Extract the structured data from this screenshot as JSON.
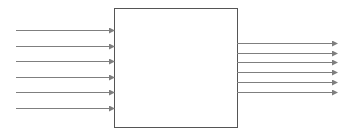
{
  "diagram": {
    "background": "#ffffff",
    "line_color": "#7f7f7f",
    "box_border_color": "#555555",
    "box": {
      "x": 114,
      "y": 8,
      "width": 123,
      "height": 119
    },
    "inputs": {
      "count": 6,
      "x_start": 16,
      "x_end": 114,
      "y": [
        30,
        46,
        61,
        77,
        92,
        108
      ]
    },
    "outputs": {
      "count": 6,
      "x_start": 237,
      "x_end": 337,
      "y": [
        43,
        53,
        62,
        72,
        82,
        92
      ]
    }
  }
}
